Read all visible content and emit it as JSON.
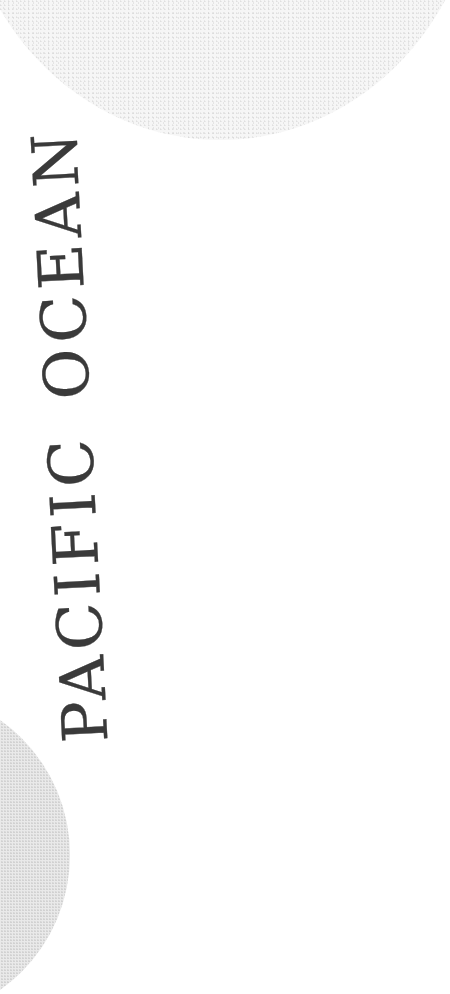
{
  "map": {
    "label_word_1": "PACIFIC",
    "label_word_2": "OCEAN",
    "label_orientation": "vertical, reading bottom-to-top",
    "colors": {
      "background": "#ffffff",
      "land_stipple": "#e9e9e9",
      "label_ink": "#3a3a3a"
    }
  }
}
